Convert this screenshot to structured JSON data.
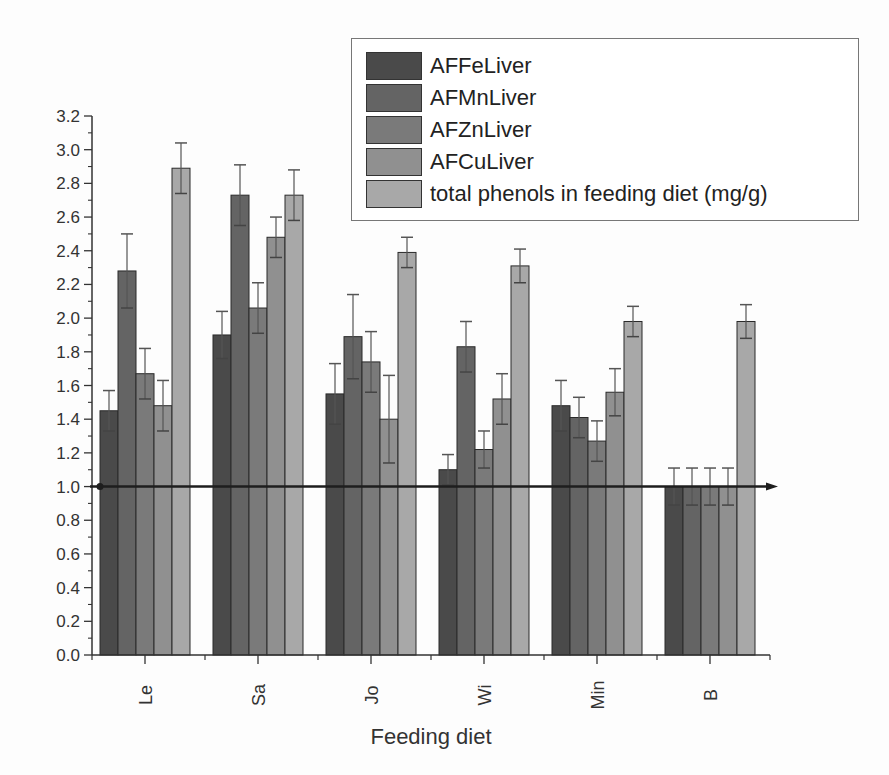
{
  "chart_data": {
    "type": "bar",
    "title": "",
    "xlabel": "Feeding diet",
    "ylabel": "",
    "ylim": [
      0.0,
      3.2
    ],
    "yticks": [
      0.0,
      0.2,
      0.4,
      0.6,
      0.8,
      1.0,
      1.2,
      1.4,
      1.6,
      1.8,
      2.0,
      2.2,
      2.4,
      2.6,
      2.8,
      3.0,
      3.2
    ],
    "ytick_labels": [
      "0.0",
      "0.2",
      "0.4",
      "0.6",
      "0.8",
      "1.0",
      "1.2",
      "1.4",
      "1.6",
      "1.8",
      "2.0",
      "2.2",
      "2.4",
      "2.6",
      "2.8",
      "3.0",
      "3.2"
    ],
    "categories": [
      "Le",
      "Sa",
      "Jo",
      "Wi",
      "Min",
      "B"
    ],
    "grid": false,
    "legend_position": "top-right",
    "reference_line": {
      "y": 1.0,
      "style": "horizontal arrow"
    },
    "series": [
      {
        "name": "AFFeLiver",
        "color": "#4a4a4a",
        "values": [
          1.45,
          1.9,
          1.55,
          1.1,
          1.48,
          1.0
        ],
        "errors": [
          0.12,
          0.14,
          0.18,
          0.09,
          0.15,
          0.11
        ]
      },
      {
        "name": "AFMnLiver",
        "color": "#646464",
        "values": [
          2.28,
          2.73,
          1.89,
          1.83,
          1.41,
          1.0
        ],
        "errors": [
          0.22,
          0.18,
          0.25,
          0.15,
          0.12,
          0.11
        ]
      },
      {
        "name": "AFZnLiver",
        "color": "#7a7a7a",
        "values": [
          1.67,
          2.06,
          1.74,
          1.22,
          1.27,
          1.0
        ],
        "errors": [
          0.15,
          0.15,
          0.18,
          0.11,
          0.12,
          0.11
        ]
      },
      {
        "name": "AFCuLiver",
        "color": "#909090",
        "values": [
          1.48,
          2.48,
          1.4,
          1.52,
          1.56,
          1.0
        ],
        "errors": [
          0.15,
          0.12,
          0.26,
          0.15,
          0.14,
          0.11
        ]
      },
      {
        "name": "total phenols in feeding diet (mg/g)",
        "color": "#a8a8a8",
        "values": [
          2.89,
          2.73,
          2.39,
          2.31,
          1.98,
          1.98
        ],
        "errors": [
          0.15,
          0.15,
          0.09,
          0.1,
          0.09,
          0.1
        ]
      }
    ]
  }
}
